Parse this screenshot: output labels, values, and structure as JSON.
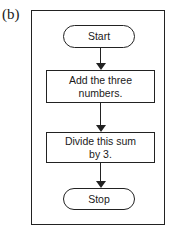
{
  "figure_label": "(b)",
  "flowchart": {
    "nodes": [
      {
        "id": "start",
        "type": "terminal",
        "text": "Start"
      },
      {
        "id": "step1",
        "type": "process",
        "text": "Add the three numbers."
      },
      {
        "id": "step2",
        "type": "process",
        "text": "Divide this sum by 3."
      },
      {
        "id": "stop",
        "type": "terminal",
        "text": "Stop"
      }
    ],
    "edges": [
      {
        "from": "start",
        "to": "step1"
      },
      {
        "from": "step1",
        "to": "step2"
      },
      {
        "from": "step2",
        "to": "stop"
      }
    ]
  }
}
